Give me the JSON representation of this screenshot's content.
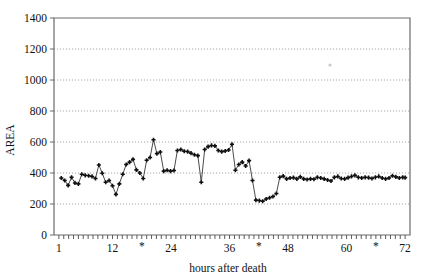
{
  "chart_data": {
    "type": "line",
    "title": "",
    "subtitle": "",
    "xlabel": "hours after death",
    "ylabel": "AREA",
    "xlim": [
      0,
      73
    ],
    "ylim": [
      0,
      1400
    ],
    "grid": true,
    "legend": null,
    "legend_position": "none",
    "y_ticks": [
      0,
      200,
      400,
      600,
      800,
      1000,
      1200,
      1400
    ],
    "y_tick_labels": [
      "0",
      "200",
      "400",
      "600",
      "800",
      "1000",
      "1200",
      "1400"
    ],
    "x_ticks": [
      1,
      12,
      18,
      24,
      36,
      42,
      48,
      60,
      66,
      72
    ],
    "x_tick_labels": [
      "1",
      "12",
      "*",
      "24",
      "36",
      "*",
      "48",
      "60",
      "*",
      "72"
    ],
    "x_minor_tick_step": 1,
    "marker": "plus-filled",
    "marker_size": 4,
    "annotations": [
      {
        "label": "*",
        "x": 18,
        "note": "asterisk tick marker on x-axis"
      },
      {
        "label": "*",
        "x": 42,
        "note": "asterisk tick marker on x-axis"
      },
      {
        "label": "*",
        "x": 66,
        "note": "asterisk tick marker on x-axis"
      }
    ],
    "series": [
      {
        "name": "AREA",
        "color": "#101010",
        "x": [
          1.5,
          2.2,
          2.9,
          3.6,
          4.3,
          5.0,
          5.7,
          6.4,
          7.1,
          7.8,
          8.5,
          9.2,
          9.9,
          10.6,
          11.3,
          12.0,
          12.7,
          13.4,
          14.1,
          14.8,
          15.5,
          16.2,
          16.9,
          17.6,
          18.3,
          19.0,
          19.7,
          20.4,
          21.1,
          21.8,
          22.5,
          23.2,
          23.9,
          24.6,
          25.3,
          26.0,
          26.7,
          27.4,
          28.1,
          28.8,
          29.5,
          30.2,
          30.9,
          31.6,
          32.3,
          33.0,
          33.7,
          34.4,
          35.1,
          35.8,
          36.5,
          37.2,
          37.9,
          38.6,
          39.3,
          40.0,
          40.7,
          41.4,
          42.1,
          42.8,
          43.5,
          44.2,
          44.9,
          45.6,
          46.3,
          47.0,
          47.7,
          48.4,
          49.1,
          49.8,
          50.5,
          51.2,
          51.9,
          52.6,
          53.3,
          54.0,
          54.7,
          55.4,
          56.1,
          56.8,
          57.5,
          58.2,
          58.9,
          59.6,
          60.3,
          61.0,
          61.7,
          62.4,
          63.1,
          63.8,
          64.5,
          65.2,
          65.9,
          66.6,
          67.3,
          68.0,
          68.7,
          69.4,
          70.1,
          70.8,
          71.5,
          72.0
        ],
        "values": [
          368,
          352,
          320,
          372,
          336,
          330,
          392,
          385,
          382,
          378,
          365,
          452,
          398,
          340,
          352,
          318,
          262,
          330,
          392,
          455,
          470,
          488,
          420,
          400,
          365,
          482,
          500,
          615,
          525,
          535,
          412,
          418,
          412,
          416,
          545,
          552,
          540,
          538,
          528,
          518,
          512,
          340,
          552,
          570,
          578,
          575,
          545,
          538,
          542,
          548,
          585,
          418,
          455,
          470,
          445,
          480,
          352,
          225,
          222,
          218,
          232,
          240,
          248,
          268,
          372,
          380,
          362,
          368,
          370,
          362,
          375,
          362,
          358,
          362,
          360,
          372,
          368,
          362,
          355,
          348,
          372,
          378,
          365,
          362,
          370,
          378,
          385,
          372,
          368,
          372,
          370,
          365,
          372,
          378,
          368,
          362,
          368,
          382,
          375,
          368,
          372,
          370
        ]
      }
    ]
  }
}
